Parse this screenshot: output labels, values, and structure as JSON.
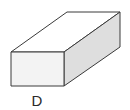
{
  "figure": {
    "label": "D",
    "shape": "rectangular-prism",
    "colors": {
      "stroke": "#3a3a3a",
      "front_face": "#f3f3f3",
      "top_face": "#ffffff",
      "side_face": "#dedede"
    }
  }
}
